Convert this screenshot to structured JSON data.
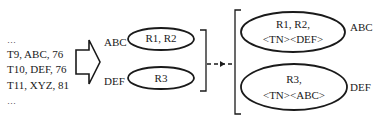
{
  "input_list": {
    "lines": [
      "…",
      "T9, ABC, 76",
      "T10, DEF, 76",
      "T11, XYZ, 81",
      "…"
    ]
  },
  "stage1": {
    "groups": [
      {
        "key": "ABC",
        "content": "R1, R2"
      },
      {
        "key": "DEF",
        "content": "R3"
      }
    ]
  },
  "stage2": {
    "groups": [
      {
        "key": "ABC",
        "line1": "R1, R2,",
        "line2": "<TN><DEF>"
      },
      {
        "key": "DEF",
        "line1": "R3,",
        "line2": "<TN><ABC>"
      }
    ]
  },
  "colors": {
    "stroke": "#1a1a1a",
    "background": "#ffffff"
  }
}
